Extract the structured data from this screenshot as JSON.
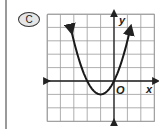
{
  "choice": {
    "label": "C"
  },
  "axes": {
    "x_label": "x",
    "y_label": "y",
    "origin_label": "O"
  },
  "chart_data": {
    "type": "line",
    "title": "",
    "xlabel": "x",
    "ylabel": "y",
    "grid": true,
    "xlim": [
      -5,
      3
    ],
    "ylim": [
      -3,
      5
    ],
    "equation": "y = x^2 + 2x",
    "series": [
      {
        "name": "parabola",
        "x": [
          -3.2,
          -3,
          -2.5,
          -2,
          -1.5,
          -1,
          -0.5,
          0,
          0.5,
          1,
          1.2
        ],
        "y": [
          3.84,
          3,
          1.25,
          0,
          -0.75,
          -1,
          -0.75,
          0,
          1.25,
          3,
          3.84
        ]
      }
    ],
    "annotations": [
      "vertex (-1, -1)",
      "passes through origin O (0, 0) and (-2, 0)",
      "arrows at both ends of the curve"
    ]
  }
}
